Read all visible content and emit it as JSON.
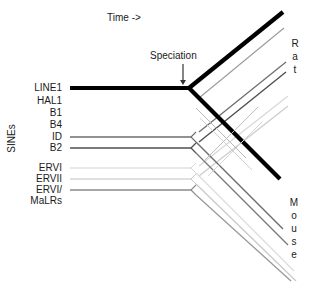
{
  "figure": {
    "title_axis": "Time ->",
    "vertical_axis_label": "SINEs",
    "annotation": "Speciation",
    "species": {
      "top": [
        "R",
        "a",
        "t"
      ],
      "bottom": [
        "M",
        "o",
        "u",
        "s",
        "e"
      ]
    },
    "colors": {
      "line1": "#000000",
      "dark_gray": "#555555",
      "mid_gray": "#888888",
      "light_gray": "#bbbbbb",
      "very_light_gray": "#dddddd",
      "text": "#1a1a1a",
      "background": "#ffffff"
    }
  },
  "rows": [
    {
      "label": "LINE1",
      "y": 88,
      "has_line": true,
      "color": "#000000",
      "width": 4.0
    },
    {
      "label": "HAL1",
      "y": 101,
      "has_line": false,
      "color": "#999999",
      "width": 1.0
    },
    {
      "label": "B1",
      "y": 113,
      "has_line": false,
      "color": "#999999",
      "width": 1.0
    },
    {
      "label": "B4",
      "y": 125,
      "has_line": false,
      "color": "#999999",
      "width": 1.0
    },
    {
      "label": "ID",
      "y": 137,
      "has_line": true,
      "color": "#6e6e6e",
      "width": 1.4
    },
    {
      "label": "B2",
      "y": 148,
      "has_line": true,
      "color": "#4f4f4f",
      "width": 1.6
    },
    {
      "label": "ERVI",
      "y": 168,
      "has_line": true,
      "color": "#d2d2d2",
      "width": 1.2
    },
    {
      "label": "ERVII",
      "y": 179,
      "has_line": true,
      "color": "#c0c0c0",
      "width": 1.2
    },
    {
      "label": "ERVI/",
      "y": 190,
      "has_line": true,
      "color": "#8a8a8a",
      "width": 1.4
    },
    {
      "label": "MaLRs",
      "y": 201,
      "has_line": false,
      "color": "#8a8a8a",
      "width": 1.2
    }
  ],
  "branch_point": {
    "x": 189,
    "y": 88
  },
  "speciation_arrow": {
    "x": 183,
    "y_top": 64,
    "y_bottom": 85
  }
}
